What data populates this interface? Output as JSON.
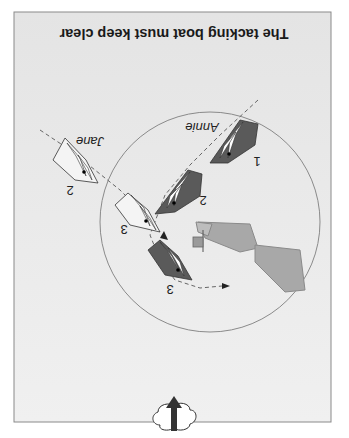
{
  "title": "The tacking boat must keep clear",
  "orientation": "rotated 180 degrees",
  "boats": [
    {
      "name": "Annie",
      "color": "dark-grey",
      "positions": [
        "1",
        "2",
        "3"
      ]
    },
    {
      "name": "Jane",
      "color": "white",
      "positions": [
        "2",
        "3"
      ]
    }
  ],
  "labels": {
    "annie": "Annie",
    "jane": "Jane",
    "annie_pos1": "1",
    "annie_pos2": "2",
    "annie_pos3": "3",
    "jane_pos2": "2",
    "jane_pos3": "3"
  },
  "elements": {
    "wind_icon": "wind-cloud-arrow",
    "mark_boat": "committee-boat-with-flag",
    "zone_circle": "three-length-zone"
  },
  "colors": {
    "panel_bg": "#ececec",
    "panel_border": "#8a8a8a",
    "annie_hull": "#5a5a5a",
    "jane_hull": "#f4f4f4",
    "committee_boat": "#a8a8a8",
    "sail": "#ffffff",
    "circle": "#8a8a8a"
  }
}
